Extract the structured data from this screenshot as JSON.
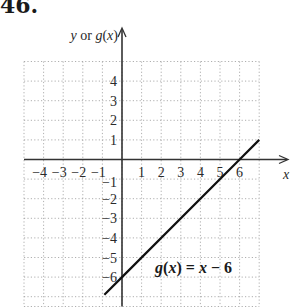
{
  "problem_number": "46.",
  "chart_data": {
    "type": "line",
    "title": "",
    "xlabel": "x",
    "ylabel": "y or g(x)",
    "xlim": [
      -5,
      7
    ],
    "ylim": [
      -7.5,
      5
    ],
    "grid": true,
    "x_tick_labels": [
      "-4",
      "-3",
      "-2",
      "-1",
      "1",
      "2",
      "3",
      "4",
      "5",
      "6"
    ],
    "y_tick_labels": [
      "4",
      "3",
      "2",
      "1",
      "-1",
      "-2",
      "-3",
      "-4",
      "-5",
      "-6"
    ],
    "series": [
      {
        "name": "g(x) = x - 6",
        "function": "x - 6",
        "x": [
          -0.9,
          0,
          6,
          7
        ],
        "y": [
          -6.9,
          -6,
          0,
          1
        ]
      }
    ],
    "annotations": [
      {
        "text": "g(x) = x − 6",
        "x": 2.2,
        "y": -5.6
      }
    ]
  },
  "labels": {
    "y_axis": "y or g(x)",
    "x_axis": "x",
    "equation": "g(x) = x − 6"
  }
}
